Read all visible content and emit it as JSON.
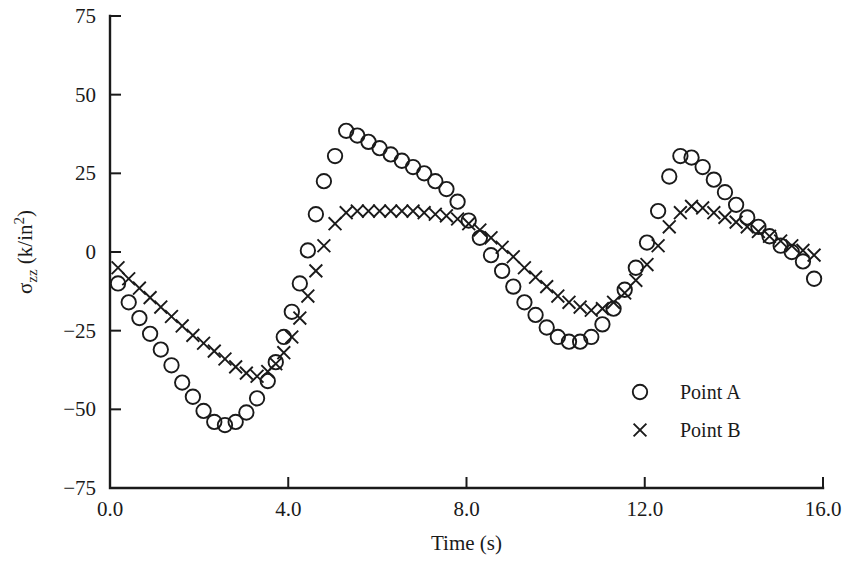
{
  "chart_data": {
    "type": "scatter",
    "title": "",
    "xlabel": "Time (s)",
    "ylabel": "σzz (k/in2)",
    "ylabel_parts": {
      "sigma": "σ",
      "sub": "zz",
      "unit_open": " (k/in",
      "sup": "2",
      "unit_close": ")"
    },
    "xlim": [
      0.0,
      16.0
    ],
    "ylim": [
      -75,
      75
    ],
    "xticks": [
      0.0,
      4.0,
      8.0,
      12.0,
      16.0
    ],
    "xtick_labels": [
      "0.0",
      "4.0",
      "8.0",
      "12.0",
      "16.0"
    ],
    "yticks": [
      75,
      50,
      25,
      0,
      -25,
      -50,
      -75
    ],
    "ytick_labels": [
      "75",
      "50",
      "25",
      "0",
      "−25",
      "−50",
      "−75"
    ],
    "grid": false,
    "legend_position": "lower-right",
    "series": [
      {
        "name": "Point A",
        "marker": "circle",
        "x": [
          0.18,
          0.42,
          0.66,
          0.9,
          1.14,
          1.38,
          1.62,
          1.86,
          2.1,
          2.34,
          2.58,
          2.82,
          3.06,
          3.3,
          3.54,
          3.72,
          3.9,
          4.08,
          4.26,
          4.44,
          4.62,
          4.8,
          5.05,
          5.3,
          5.55,
          5.8,
          6.05,
          6.3,
          6.55,
          6.8,
          7.05,
          7.3,
          7.55,
          7.8,
          8.05,
          8.3,
          8.55,
          8.8,
          9.05,
          9.3,
          9.55,
          9.8,
          10.05,
          10.3,
          10.55,
          10.8,
          11.05,
          11.3,
          11.55,
          11.8,
          12.05,
          12.3,
          12.55,
          12.8,
          13.05,
          13.3,
          13.55,
          13.8,
          14.05,
          14.3,
          14.55,
          14.8,
          15.05,
          15.3,
          15.55,
          15.8
        ],
        "y": [
          -10.0,
          -16.0,
          -21.0,
          -26.0,
          -31.0,
          -36.0,
          -41.5,
          -46.0,
          -50.5,
          -54.0,
          -55.0,
          -54.0,
          -51.0,
          -46.5,
          -41.0,
          -35.0,
          -27.0,
          -19.0,
          -10.0,
          0.5,
          12.0,
          22.5,
          30.5,
          38.5,
          37.0,
          35.0,
          33.0,
          31.0,
          29.0,
          27.0,
          25.0,
          22.5,
          20.0,
          16.0,
          10.0,
          4.5,
          -1.0,
          -6.0,
          -11.0,
          -16.0,
          -20.0,
          -24.0,
          -27.0,
          -28.5,
          -28.5,
          -27.0,
          -23.0,
          -18.0,
          -12.0,
          -5.0,
          3.0,
          13.0,
          24.0,
          30.5,
          30.0,
          27.0,
          23.0,
          19.0,
          15.0,
          11.0,
          8.0,
          5.0,
          2.0,
          0.0,
          -3.0,
          -8.5
        ]
      },
      {
        "name": "Point B",
        "marker": "cross",
        "x": [
          0.18,
          0.42,
          0.66,
          0.9,
          1.14,
          1.38,
          1.62,
          1.86,
          2.1,
          2.34,
          2.58,
          2.82,
          3.06,
          3.3,
          3.54,
          3.72,
          3.9,
          4.08,
          4.26,
          4.44,
          4.62,
          4.8,
          5.05,
          5.3,
          5.55,
          5.8,
          6.05,
          6.3,
          6.55,
          6.8,
          7.05,
          7.3,
          7.55,
          7.8,
          8.05,
          8.3,
          8.55,
          8.8,
          9.05,
          9.3,
          9.55,
          9.8,
          10.05,
          10.3,
          10.55,
          10.8,
          11.05,
          11.3,
          11.55,
          11.8,
          12.05,
          12.3,
          12.55,
          12.8,
          13.05,
          13.3,
          13.55,
          13.8,
          14.05,
          14.3,
          14.55,
          14.8,
          15.05,
          15.3,
          15.55,
          15.8
        ],
        "y": [
          -5.0,
          -8.5,
          -11.5,
          -14.5,
          -17.5,
          -20.5,
          -23.5,
          -26.5,
          -29.0,
          -31.5,
          -34.0,
          -36.5,
          -38.5,
          -39.5,
          -38.0,
          -35.5,
          -32.0,
          -27.0,
          -21.0,
          -14.0,
          -6.0,
          2.0,
          9.0,
          12.5,
          13.0,
          13.0,
          13.0,
          13.0,
          13.0,
          13.0,
          12.5,
          12.0,
          11.5,
          10.5,
          9.0,
          7.0,
          4.5,
          1.5,
          -1.5,
          -5.0,
          -8.0,
          -11.0,
          -14.0,
          -16.0,
          -17.5,
          -18.5,
          -18.0,
          -16.0,
          -13.0,
          -9.0,
          -4.0,
          2.0,
          8.0,
          12.5,
          14.5,
          14.0,
          12.5,
          11.0,
          9.5,
          8.0,
          6.5,
          5.0,
          3.5,
          2.0,
          0.5,
          -1.0
        ]
      }
    ]
  },
  "legend": {
    "entries": [
      {
        "label": "Point A",
        "marker": "circle"
      },
      {
        "label": "Point B",
        "marker": "cross"
      }
    ]
  }
}
